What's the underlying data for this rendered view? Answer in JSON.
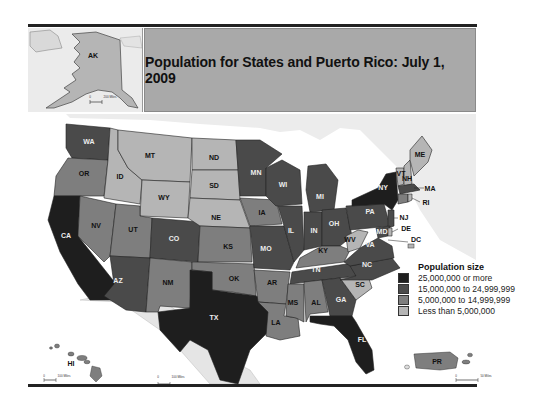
{
  "title": "Population for States and Puerto Rico: July 1, 2009",
  "legend": {
    "title": "Population size",
    "items": [
      {
        "label": "25,000,000 or more",
        "color": "#1e1e1e"
      },
      {
        "label": "15,000,000 to 24,999,999",
        "color": "#4a4a4a"
      },
      {
        "label": "5,000,000 to 14,999,999",
        "color": "#7e7e7e"
      },
      {
        "label": "Less than 5,000,000",
        "color": "#b5b5b5"
      }
    ]
  },
  "insets": {
    "alaska": {
      "label": "AK",
      "scale": "200 Miles",
      "scale_zero": "0"
    },
    "hawaii": {
      "label": "HI",
      "scale": "100 Miles",
      "scale_zero": "0"
    },
    "puerto_rico": {
      "label": "PR",
      "scale": "50 Miles",
      "scale_zero": "0"
    },
    "mainland_scale": {
      "scale": "100 Miles",
      "scale_zero": "0"
    }
  },
  "states": [
    {
      "abbr": "WA",
      "class": "15,000,000 to 24,999,999"
    },
    {
      "abbr": "OR",
      "class": "5,000,000 to 14,999,999"
    },
    {
      "abbr": "CA",
      "class": "25,000,000 or more"
    },
    {
      "abbr": "ID",
      "class": "Less than 5,000,000"
    },
    {
      "abbr": "NV",
      "class": "5,000,000 to 14,999,999"
    },
    {
      "abbr": "MT",
      "class": "Less than 5,000,000"
    },
    {
      "abbr": "WY",
      "class": "Less than 5,000,000"
    },
    {
      "abbr": "UT",
      "class": "5,000,000 to 14,999,999"
    },
    {
      "abbr": "AZ",
      "class": "15,000,000 to 24,999,999"
    },
    {
      "abbr": "CO",
      "class": "15,000,000 to 24,999,999"
    },
    {
      "abbr": "NM",
      "class": "5,000,000 to 14,999,999"
    },
    {
      "abbr": "ND",
      "class": "Less than 5,000,000"
    },
    {
      "abbr": "SD",
      "class": "Less than 5,000,000"
    },
    {
      "abbr": "NE",
      "class": "Less than 5,000,000"
    },
    {
      "abbr": "KS",
      "class": "5,000,000 to 14,999,999"
    },
    {
      "abbr": "OK",
      "class": "5,000,000 to 14,999,999"
    },
    {
      "abbr": "TX",
      "class": "25,000,000 or more"
    },
    {
      "abbr": "MN",
      "class": "15,000,000 to 24,999,999"
    },
    {
      "abbr": "IA",
      "class": "5,000,000 to 14,999,999"
    },
    {
      "abbr": "MO",
      "class": "15,000,000 to 24,999,999"
    },
    {
      "abbr": "AR",
      "class": "5,000,000 to 14,999,999"
    },
    {
      "abbr": "LA",
      "class": "5,000,000 to 14,999,999"
    },
    {
      "abbr": "WI",
      "class": "15,000,000 to 24,999,999"
    },
    {
      "abbr": "IL",
      "class": "15,000,000 to 24,999,999"
    },
    {
      "abbr": "MI",
      "class": "15,000,000 to 24,999,999"
    },
    {
      "abbr": "IN",
      "class": "15,000,000 to 24,999,999"
    },
    {
      "abbr": "OH",
      "class": "15,000,000 to 24,999,999"
    },
    {
      "abbr": "KY",
      "class": "5,000,000 to 14,999,999"
    },
    {
      "abbr": "TN",
      "class": "15,000,000 to 24,999,999"
    },
    {
      "abbr": "MS",
      "class": "5,000,000 to 14,999,999"
    },
    {
      "abbr": "AL",
      "class": "5,000,000 to 14,999,999"
    },
    {
      "abbr": "GA",
      "class": "15,000,000 to 24,999,999"
    },
    {
      "abbr": "FL",
      "class": "25,000,000 or more"
    },
    {
      "abbr": "SC",
      "class": "Less than 5,000,000"
    },
    {
      "abbr": "NC",
      "class": "15,000,000 to 24,999,999"
    },
    {
      "abbr": "VA",
      "class": "15,000,000 to 24,999,999"
    },
    {
      "abbr": "WV",
      "class": "Less than 5,000,000"
    },
    {
      "abbr": "PA",
      "class": "15,000,000 to 24,999,999"
    },
    {
      "abbr": "NY",
      "class": "25,000,000 or more"
    },
    {
      "abbr": "VT",
      "class": "Less than 5,000,000"
    },
    {
      "abbr": "NH",
      "class": "Less than 5,000,000"
    },
    {
      "abbr": "ME",
      "class": "Less than 5,000,000"
    },
    {
      "abbr": "MA",
      "class": "15,000,000 to 24,999,999"
    },
    {
      "abbr": "RI",
      "class": "Less than 5,000,000"
    },
    {
      "abbr": "CT",
      "class": "5,000,000 to 14,999,999"
    },
    {
      "abbr": "NJ",
      "class": "15,000,000 to 24,999,999"
    },
    {
      "abbr": "DE",
      "class": "Less than 5,000,000"
    },
    {
      "abbr": "MD",
      "class": "15,000,000 to 24,999,999"
    },
    {
      "abbr": "DC",
      "class": "Less than 5,000,000"
    },
    {
      "abbr": "AK",
      "class": "Less than 5,000,000"
    },
    {
      "abbr": "HI",
      "class": "5,000,000 to 14,999,999"
    },
    {
      "abbr": "PR",
      "class": "5,000,000 to 14,999,999"
    }
  ]
}
